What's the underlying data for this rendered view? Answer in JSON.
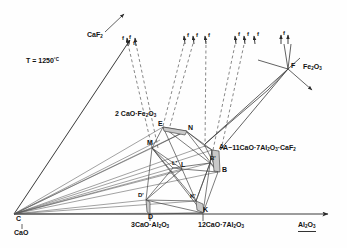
{
  "figure": {
    "kind": "ternary-phase-diagram",
    "condition_label": "T = 1250",
    "condition_unit": "°C",
    "background": "#fefefe",
    "line_color": "#3a3a3a",
    "text_color": "#111111"
  },
  "axes": {
    "left_vertex": {
      "point": "C",
      "compound_prefix": "CaO"
    },
    "right_vertex": {
      "compound_prefix": "Al",
      "compound_sub1": "2",
      "compound_mid": "O",
      "compound_sub2": "3",
      "full": "Al2O3"
    },
    "top_direction": {
      "label_prefix": "CaF",
      "label_sub": "2",
      "full": "CaF2"
    }
  },
  "compounds": [
    {
      "id": "c3a",
      "text_prefix": "3CaO·Al",
      "sub1": "2",
      "mid": "O",
      "sub2": "3",
      "full": "3CaO·Al2O3"
    },
    {
      "id": "c12a7",
      "text_prefix": "12CaO·7Al",
      "sub1": "2",
      "mid": "O",
      "sub2": "3",
      "full": "12CaO·7Al2O3"
    },
    {
      "id": "c2f",
      "text_prefix": "2 CaO·Fe",
      "sub1": "2",
      "mid": "O",
      "sub2": "3",
      "full": "2CaO·Fe2O3"
    },
    {
      "id": "a11a7",
      "text_prefix": "A−11CaO·7Al",
      "sub1": "2",
      "mid": "O",
      "sub2": "3",
      "tail": "·CaF",
      "sub3": "2",
      "full": "A-11CaO·7Al2O3·CaF2"
    },
    {
      "id": "fe2o3",
      "text_prefix": "Fe",
      "sub1": "2",
      "mid": "O",
      "sub2": "3",
      "full": "Fe2O3"
    }
  ],
  "points": [
    {
      "id": "C",
      "label": "C",
      "x": 14,
      "y": 212
    },
    {
      "id": "D",
      "label": "D",
      "x": 150,
      "y": 213
    },
    {
      "id": "Dp",
      "label": "D'",
      "x": 146,
      "y": 198
    },
    {
      "id": "K",
      "label": "K",
      "x": 203,
      "y": 212
    },
    {
      "id": "Kp",
      "label": "K'",
      "x": 196,
      "y": 199
    },
    {
      "id": "B",
      "label": "B",
      "x": 219,
      "y": 172
    },
    {
      "id": "Bp",
      "label": "B'",
      "x": 210,
      "y": 161
    },
    {
      "id": "L",
      "label": "L",
      "x": 182,
      "y": 167
    },
    {
      "id": "Lp",
      "label": "L'",
      "x": 173,
      "y": 166
    },
    {
      "id": "M",
      "label": "M",
      "x": 152,
      "y": 146
    },
    {
      "id": "N",
      "label": "N",
      "x": 186,
      "y": 129
    },
    {
      "id": "E",
      "label": "E",
      "x": 163,
      "y": 126
    },
    {
      "id": "A",
      "label": "A",
      "x": 218,
      "y": 148
    },
    {
      "id": "F",
      "label": "F",
      "x": 290,
      "y": 68
    }
  ],
  "arrow_markers": [
    {
      "label": "f",
      "x": 129,
      "y": 36
    },
    {
      "label": "f",
      "x": 186,
      "y": 33
    },
    {
      "label": "f",
      "x": 196,
      "y": 33
    },
    {
      "label": "f",
      "x": 207,
      "y": 34
    },
    {
      "label": "f",
      "x": 236,
      "y": 32
    },
    {
      "label": "f",
      "x": 246,
      "y": 32
    },
    {
      "label": "f",
      "x": 256,
      "y": 32
    },
    {
      "label": "f",
      "x": 281,
      "y": 31
    },
    {
      "label": "f",
      "x": 289,
      "y": 31
    }
  ]
}
